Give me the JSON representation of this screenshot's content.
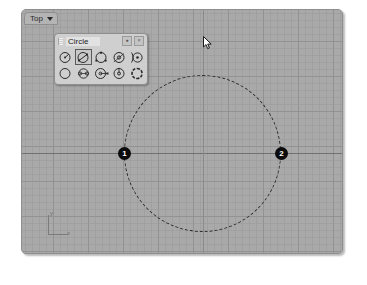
{
  "app": {
    "background_color": "#ffffff",
    "viewport_background": "#a9a9a9"
  },
  "viewport": {
    "label": "Top",
    "dropdown_icon": "chevron-down-icon",
    "grid_minor_spacing_px": 7,
    "grid_major_spacing_px": 35,
    "axis_gizmo": {
      "y_label": "y",
      "x_label": "x"
    }
  },
  "geometry": {
    "shape": "circle",
    "style": "dashed",
    "color": "#2c2c2c",
    "center_px": [
      202,
      153
    ],
    "diameter_px": 157,
    "points": [
      {
        "label": "1",
        "name": "point-1",
        "x_px": 124,
        "y_px": 153
      },
      {
        "label": "2",
        "name": "point-2",
        "x_px": 281,
        "y_px": 153
      }
    ]
  },
  "cursor": {
    "type": "arrow-cursor",
    "x_px": 203,
    "y_px": 44
  },
  "palette": {
    "title": "Circle",
    "grip_icon": "drag-grip-icon",
    "buttons": [
      {
        "name": "palette-options-button",
        "glyph": "●"
      },
      {
        "name": "palette-close-button",
        "glyph": "×"
      }
    ],
    "rows": [
      [
        {
          "name": "circle-center-radius-tool",
          "icon": "circle-center-radius-icon",
          "selected": false
        },
        {
          "name": "circle-diameter-tool",
          "icon": "circle-diameter-icon",
          "selected": true
        },
        {
          "name": "circle-3-point-tool",
          "icon": "circle-3-point-icon",
          "selected": false
        },
        {
          "name": "circle-tangent-tangent-radius-tool",
          "icon": "circle-tangent-radius-icon",
          "selected": false
        },
        {
          "name": "circle-tangent-to-curves-tool",
          "icon": "circle-tangent-curves-icon",
          "selected": false
        }
      ],
      [
        {
          "name": "circle-around-curve-tool",
          "icon": "circle-around-curve-icon",
          "selected": false
        },
        {
          "name": "circle-fit-points-tool",
          "icon": "circle-fit-points-icon",
          "selected": false
        },
        {
          "name": "circle-deformable-tool",
          "icon": "circle-deformable-icon",
          "selected": false
        },
        {
          "name": "circle-vertical-tool",
          "icon": "circle-vertical-icon",
          "selected": false
        },
        {
          "name": "circle-sketch-tool",
          "icon": "circle-sketch-icon",
          "selected": false
        }
      ]
    ]
  }
}
